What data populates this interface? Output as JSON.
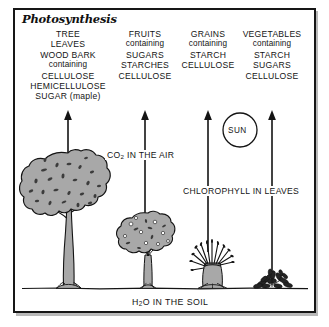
{
  "figure": {
    "title": "Photosynthesis",
    "border_color": "#161616",
    "background": "#ffffff",
    "ink_color": "#141414",
    "foliage_fill": "#a8a8a8"
  },
  "columns": [
    {
      "id": "tree-column",
      "center_x": 68,
      "lines": [
        {
          "text": "TREE",
          "emphasis": "caps"
        },
        {
          "text": "LEAVES",
          "emphasis": "caps"
        },
        {
          "text": "WOOD BARK",
          "emphasis": "caps"
        },
        {
          "text": "containing",
          "emphasis": "lower"
        },
        {
          "text": "CELLULOSE",
          "emphasis": "caps"
        },
        {
          "text": "HEMICELLULOSE",
          "emphasis": "caps"
        },
        {
          "text": "SUGAR (maple)",
          "emphasis": "caps"
        }
      ]
    },
    {
      "id": "fruits-column",
      "center_x": 145,
      "lines": [
        {
          "text": "FRUITS",
          "emphasis": "caps"
        },
        {
          "text": "containing",
          "emphasis": "lower"
        },
        {
          "text": "SUGARS",
          "emphasis": "caps"
        },
        {
          "text": "STARCHES",
          "emphasis": "caps"
        },
        {
          "text": "CELLULOSE",
          "emphasis": "caps"
        }
      ]
    },
    {
      "id": "grains-column",
      "center_x": 208,
      "lines": [
        {
          "text": "GRAINS",
          "emphasis": "caps"
        },
        {
          "text": "containing",
          "emphasis": "lower"
        },
        {
          "text": "STARCH",
          "emphasis": "caps"
        },
        {
          "text": "CELLULOSE",
          "emphasis": "caps"
        }
      ]
    },
    {
      "id": "vegetables-column",
      "center_x": 272,
      "lines": [
        {
          "text": "VEGETABLES",
          "emphasis": "caps"
        },
        {
          "text": "containing",
          "emphasis": "lower"
        },
        {
          "text": "STARCH",
          "emphasis": "caps"
        },
        {
          "text": "SUGARS",
          "emphasis": "caps"
        },
        {
          "text": "CELLULOSE",
          "emphasis": "caps"
        }
      ]
    }
  ],
  "labels": {
    "sun": "SUN",
    "co2_prefix": "CO",
    "co2_subscript": "2",
    "co2_suffix": " IN THE AIR",
    "chlorophyll": "CHLOROPHYLL IN LEAVES",
    "water_prefix": "H",
    "water_subscript": "2",
    "water_suffix": "O IN THE SOIL"
  },
  "arrows": [
    {
      "id": "arrow-tree",
      "x": 68,
      "tip_y": 112,
      "tail_y": 168
    },
    {
      "id": "arrow-fruits",
      "x": 145,
      "tip_y": 112,
      "tail_y": 248
    },
    {
      "id": "arrow-grains",
      "x": 208,
      "tip_y": 112,
      "tail_y": 252
    },
    {
      "id": "arrow-vegetables",
      "x": 272,
      "tip_y": 112,
      "tail_y": 272
    }
  ],
  "sun": {
    "center_x": 240,
    "center_y": 130,
    "radius": 17
  },
  "ground": {
    "y": 288,
    "x_start": 22,
    "x_end": 308
  },
  "plants": [
    {
      "id": "large-tree",
      "type": "deciduous-tree",
      "center_x": 68,
      "base_y": 288
    },
    {
      "id": "fruit-tree",
      "type": "fruit-tree",
      "center_x": 148,
      "base_y": 288
    },
    {
      "id": "grain-shock",
      "type": "grain-sheaf",
      "center_x": 212,
      "base_y": 288
    },
    {
      "id": "vegetable-plant",
      "type": "leafy-vegetable",
      "center_x": 272,
      "base_y": 288
    }
  ]
}
